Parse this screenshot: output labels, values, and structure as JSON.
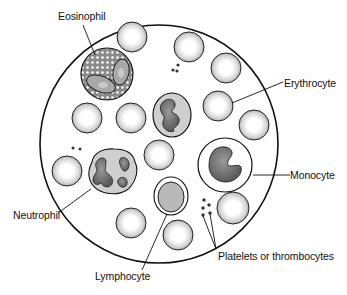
{
  "diagram": {
    "labels": {
      "eosinophil": "Eosinophil",
      "erythrocyte": "Erythrocyte",
      "monocyte": "Monocyte",
      "neutrophil": "Neutrophil",
      "lymphocyte": "Lymphocyte",
      "platelets": "Platelets or thrombocytes"
    },
    "colors": {
      "outline": "#111111",
      "rbc_rim": "#b8b8b8",
      "rbc_center": "#ffffff",
      "cytoplasm": "#cfcfcf",
      "nucleus": "#6e6e6e",
      "background": "#ffffff"
    }
  }
}
